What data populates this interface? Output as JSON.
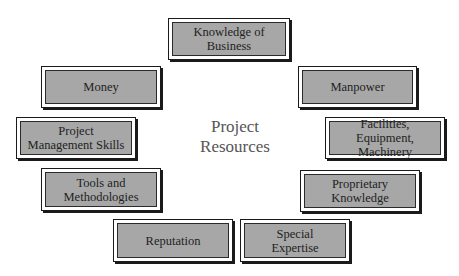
{
  "diagram": {
    "center_label": "Project\nResources",
    "colors": {
      "box_fill": "#a7a7a7",
      "box_border": "#1a1a1a",
      "bevel": "#ffffff",
      "text": "#222222",
      "center_text": "#555555",
      "background": "#ffffff"
    },
    "resources": [
      {
        "id": "knowledge-of-business",
        "label": "Knowledge of\nBusiness",
        "x": 168,
        "y": 18,
        "w": 122,
        "h": 42
      },
      {
        "id": "money",
        "label": "Money",
        "x": 41,
        "y": 66,
        "w": 120,
        "h": 42
      },
      {
        "id": "manpower",
        "label": "Manpower",
        "x": 298,
        "y": 66,
        "w": 119,
        "h": 42
      },
      {
        "id": "project-management-skills",
        "label": "Project\nManagement Skills",
        "x": 16,
        "y": 117,
        "w": 120,
        "h": 42
      },
      {
        "id": "facilities-equipment-machinery",
        "label": "Facilities, Equipment,\nMachinery",
        "x": 325,
        "y": 117,
        "w": 120,
        "h": 42
      },
      {
        "id": "tools-and-methodologies",
        "label": "Tools and\nMethodologies",
        "x": 41,
        "y": 168,
        "w": 120,
        "h": 43
      },
      {
        "id": "proprietary-knowledge",
        "label": "Proprietary\nKnowledge",
        "x": 300,
        "y": 170,
        "w": 120,
        "h": 42
      },
      {
        "id": "reputation",
        "label": "Reputation",
        "x": 113,
        "y": 219,
        "w": 120,
        "h": 43
      },
      {
        "id": "special-expertise",
        "label": "Special\nExpertise",
        "x": 240,
        "y": 219,
        "w": 110,
        "h": 43
      }
    ]
  }
}
